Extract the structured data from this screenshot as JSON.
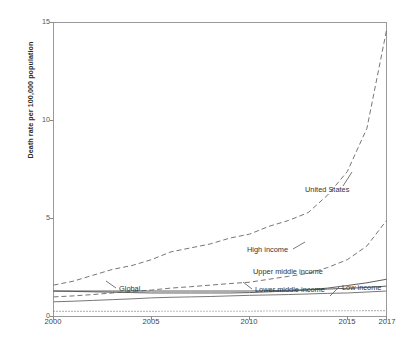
{
  "chart_data": {
    "type": "line",
    "title": "",
    "xlabel": "",
    "ylabel": "Death rate per 100,000 population",
    "xlim": [
      2000,
      2017
    ],
    "ylim": [
      0,
      15
    ],
    "yticks": [
      0,
      5,
      10,
      15
    ],
    "xticks": [
      2000,
      2005,
      2010,
      2015,
      2017
    ],
    "grid": false,
    "legend_position": "inline-annotations",
    "x": [
      2000,
      2001,
      2002,
      2003,
      2004,
      2005,
      2006,
      2007,
      2008,
      2009,
      2010,
      2011,
      2012,
      2013,
      2014,
      2015,
      2016,
      2017
    ],
    "series": [
      {
        "name": "United States",
        "style": "dashed",
        "color": "#6f6f6f",
        "values": [
          1.6,
          1.8,
          2.1,
          2.4,
          2.6,
          2.9,
          3.3,
          3.5,
          3.7,
          4.0,
          4.2,
          4.6,
          4.9,
          5.3,
          6.2,
          7.4,
          9.6,
          14.6
        ]
      },
      {
        "name": "High income",
        "style": "dashed",
        "color": "#6f6f6f",
        "values": [
          1.0,
          1.05,
          1.12,
          1.2,
          1.28,
          1.35,
          1.45,
          1.52,
          1.6,
          1.68,
          1.75,
          1.9,
          2.05,
          2.2,
          2.5,
          2.9,
          3.6,
          4.9
        ]
      },
      {
        "name": "Upper middle income",
        "style": "solid",
        "color": "#555555",
        "values": [
          1.3,
          1.28,
          1.26,
          1.24,
          1.22,
          1.2,
          1.2,
          1.2,
          1.2,
          1.2,
          1.22,
          1.26,
          1.3,
          1.36,
          1.45,
          1.58,
          1.72,
          1.9
        ]
      },
      {
        "name": "Global",
        "style": "solid",
        "color": "#555555",
        "values": [
          1.3,
          1.3,
          1.3,
          1.3,
          1.3,
          1.3,
          1.3,
          1.3,
          1.3,
          1.3,
          1.3,
          1.32,
          1.34,
          1.36,
          1.4,
          1.44,
          1.48,
          1.55
        ]
      },
      {
        "name": "Lower middle income",
        "style": "solid",
        "color": "#707070",
        "values": [
          0.75,
          0.78,
          0.82,
          0.86,
          0.9,
          0.95,
          0.98,
          1.0,
          1.02,
          1.05,
          1.08,
          1.1,
          1.12,
          1.15,
          1.18,
          1.2,
          1.25,
          1.3
        ]
      },
      {
        "name": "Low income",
        "style": "dotted",
        "color": "#7a7a7a",
        "values": [
          0.26,
          0.26,
          0.26,
          0.26,
          0.26,
          0.26,
          0.27,
          0.27,
          0.27,
          0.27,
          0.27,
          0.28,
          0.28,
          0.28,
          0.29,
          0.29,
          0.3,
          0.3
        ]
      }
    ],
    "annotations": [
      {
        "text": "United States",
        "x_px": 305,
        "y_px": 190
      },
      {
        "text": "High income",
        "x_px": 247,
        "y_px": 250
      },
      {
        "text": "Upper middle income",
        "x_px": 253,
        "y_px": 272
      },
      {
        "text": "Global",
        "x_px": 120,
        "y_px": 290
      },
      {
        "text": "Lower middle income",
        "x_px": 255,
        "y_px": 291
      },
      {
        "text": "Low income",
        "x_px": 341,
        "y_px": 288
      }
    ]
  },
  "axis": {
    "ylabel": "Death rate per 100,000 population",
    "yticks": [
      "0",
      "5",
      "10",
      "15"
    ],
    "xticks": [
      "2000",
      "2005",
      "2010",
      "2015",
      "2017"
    ]
  },
  "labels": {
    "united_states": "United States",
    "high_income": "High income",
    "upper_middle_income": "Upper middle income",
    "global": "Global",
    "lower_middle_income": "Lower middle income",
    "low_income": "Low income"
  }
}
